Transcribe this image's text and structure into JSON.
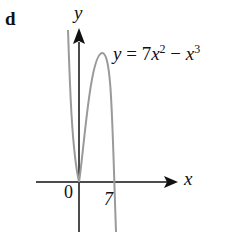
{
  "figure": {
    "panel_label": "d",
    "y_axis_label": "y",
    "x_axis_label": "x",
    "equation": {
      "prefix": "y = 7",
      "var1": "x",
      "exp1": "2",
      "minus": " − ",
      "var2": "x",
      "exp2": "3"
    },
    "origin_label": "0",
    "root_label": "7"
  },
  "colors": {
    "axis": "#111111",
    "curve": "#9a9a9a"
  }
}
